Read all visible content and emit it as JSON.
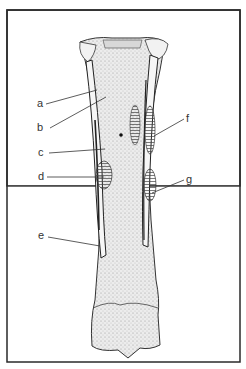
{
  "figure": {
    "labels": [
      {
        "key": "a",
        "text": "a"
      },
      {
        "key": "b",
        "text": "b"
      },
      {
        "key": "c",
        "text": "c"
      },
      {
        "key": "d",
        "text": "d"
      },
      {
        "key": "e",
        "text": "e"
      },
      {
        "key": "f",
        "text": "f"
      },
      {
        "key": "g",
        "text": "g"
      }
    ],
    "colors": {
      "frame": "#2a2a2a",
      "ink": "#333333",
      "bone_fill": "#e4e4e4",
      "background": "#ffffff"
    }
  }
}
